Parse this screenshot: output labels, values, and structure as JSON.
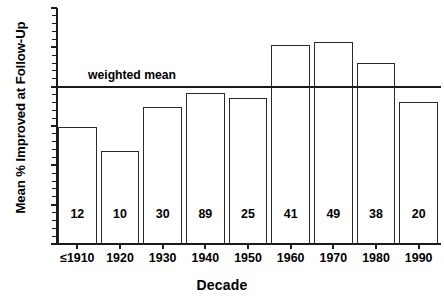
{
  "chart_data": {
    "type": "bar",
    "title": "",
    "xlabel": "Decade",
    "ylabel": "Mean % Improved at Follow-Up",
    "categories": [
      "≤1910",
      "1920",
      "1930",
      "1940",
      "1950",
      "1960",
      "1970",
      "1980",
      "1990"
    ],
    "values": [
      29.8,
      23.7,
      34.9,
      38.3,
      37.1,
      50.5,
      51.3,
      46.0,
      36.2
    ],
    "point_labels": [
      "12",
      "10",
      "30",
      "89",
      "25",
      "41",
      "49",
      "38",
      "20"
    ],
    "point_labels_meaning": "number of studies (n) printed inside each bar",
    "ylim": [
      0,
      60
    ],
    "y_major_ticks": [
      0,
      10,
      20,
      30,
      40,
      50,
      60
    ],
    "y_tick_labels": [
      "0",
      "10",
      "20",
      "30",
      "40",
      "50",
      "60"
    ],
    "y_minor_tick_step": 2,
    "grid": false,
    "legend": false,
    "annotations": [
      {
        "name": "weighted-mean",
        "label": "weighted mean",
        "type": "horizontal-line",
        "value": 39.8
      }
    ],
    "colors": {
      "bar_edge": "#2a2a2a",
      "bar_fill": "#ffffff",
      "axis": "#1a1a1a",
      "text": "#000000",
      "background": "#ffffff"
    }
  }
}
